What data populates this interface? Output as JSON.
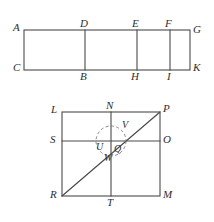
{
  "figure": {
    "stroke_color": "#4a4a4a",
    "dashed_color": "#7b7b7b",
    "background_color": "#ffffff",
    "label_color": "#2e2e2e"
  },
  "top_rectangle": {
    "name": "segmented-rectangle",
    "description": "Rectangle ACKG divided by three vertical lines DB, EH, FI",
    "outline": {
      "x": 24,
      "y": 30,
      "width": 166,
      "height": 40
    },
    "vertical_dividers": [
      85,
      137,
      170
    ],
    "vertices": {
      "A": {
        "label": "A",
        "x": 24,
        "y": 30
      },
      "C": {
        "label": "C",
        "x": 24,
        "y": 70
      },
      "G": {
        "label": "G",
        "x": 190,
        "y": 30
      },
      "K": {
        "label": "K",
        "x": 190,
        "y": 70
      }
    },
    "labels": [
      {
        "id": "A",
        "text": "A",
        "x": 13,
        "y": 22
      },
      {
        "id": "D",
        "text": "D",
        "x": 80,
        "y": 18
      },
      {
        "id": "E",
        "text": "E",
        "x": 132,
        "y": 18
      },
      {
        "id": "F",
        "text": "F",
        "x": 165,
        "y": 18
      },
      {
        "id": "G",
        "text": "G",
        "x": 193,
        "y": 24
      },
      {
        "id": "C",
        "text": "C",
        "x": 13,
        "y": 62
      },
      {
        "id": "B",
        "text": "B",
        "x": 80,
        "y": 71
      },
      {
        "id": "H",
        "text": "H",
        "x": 131,
        "y": 71
      },
      {
        "id": "I",
        "text": "I",
        "x": 167,
        "y": 71
      },
      {
        "id": "K",
        "text": "K",
        "x": 193,
        "y": 62
      }
    ]
  },
  "bottom_square": {
    "name": "subdivided-square",
    "description": "Square LPMR with midlines NT and SO, diagonal RP, and dashed circle at center",
    "outline": {
      "x": 62,
      "y": 112,
      "width": 98,
      "height": 84
    },
    "vertical_midline_x": 111,
    "horizontal_midline_y": 141,
    "diagonal": {
      "x1": 62,
      "y1": 196,
      "x2": 160,
      "y2": 112
    },
    "dashed_circle": {
      "cx": 111,
      "cy": 141,
      "r": 15
    },
    "vertices": {
      "L": {
        "label": "L",
        "x": 62,
        "y": 112
      },
      "P": {
        "label": "P",
        "x": 160,
        "y": 112
      },
      "R": {
        "label": "R",
        "x": 62,
        "y": 196
      },
      "M": {
        "label": "M",
        "x": 160,
        "y": 196
      }
    },
    "labels": [
      {
        "id": "L",
        "text": "L",
        "x": 51,
        "y": 104
      },
      {
        "id": "N",
        "text": "N",
        "x": 106,
        "y": 100
      },
      {
        "id": "P",
        "text": "P",
        "x": 163,
        "y": 103
      },
      {
        "id": "S",
        "text": "S",
        "x": 50,
        "y": 134
      },
      {
        "id": "O",
        "text": "O",
        "x": 163,
        "y": 134
      },
      {
        "id": "R",
        "text": "R",
        "x": 50,
        "y": 189
      },
      {
        "id": "T",
        "text": "T",
        "x": 107,
        "y": 197
      },
      {
        "id": "M",
        "text": "M",
        "x": 163,
        "y": 189
      },
      {
        "id": "V",
        "text": "V",
        "x": 122,
        "y": 120
      },
      {
        "id": "U",
        "text": "U",
        "x": 96,
        "y": 142
      },
      {
        "id": "Q",
        "text": "Q",
        "x": 114,
        "y": 144
      },
      {
        "id": "W",
        "text": "W",
        "x": 104,
        "y": 153
      }
    ]
  }
}
